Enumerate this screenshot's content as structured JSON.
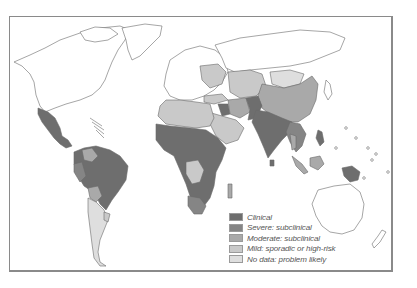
{
  "map": {
    "type": "world choropleth",
    "colors": {
      "clinical": "#6e6e6e",
      "severe_subclinical": "#858585",
      "moderate_subclinical": "#a9a9a9",
      "mild": "#c9c9c9",
      "no_data": "#dedede",
      "unshaded": "#ffffff",
      "outline": "#6a6a6a"
    }
  },
  "legend": {
    "items": [
      {
        "label": "Clinical",
        "color": "#6e6e6e"
      },
      {
        "label": "Severe: subclinical",
        "color": "#858585"
      },
      {
        "label": "Moderate: subclinical",
        "color": "#a9a9a9"
      },
      {
        "label": "Mild: sporadic or high-risk",
        "color": "#c9c9c9"
      },
      {
        "label": "No data: problem likely",
        "color": "#dedede"
      }
    ]
  }
}
